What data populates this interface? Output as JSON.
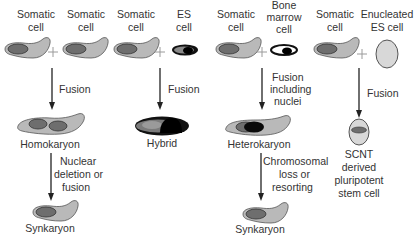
{
  "colors": {
    "cytoplasm": "#b9b9b9",
    "cytoplasm_stroke": "#555555",
    "nucleus": "#6e6e6e",
    "nucleus_dark": "#0a0a0a",
    "es_outline": "#111111",
    "enucleated": "#d8d8d8",
    "text": "#333333"
  },
  "columns": [
    {
      "id": "homokaryon",
      "inputs": [
        {
          "lines": [
            "Somatic",
            "cell"
          ],
          "type": "somatic"
        },
        {
          "lines": [
            "Somatic",
            "cell"
          ],
          "type": "somatic"
        }
      ],
      "step1": {
        "lines": [
          "Fusion"
        ]
      },
      "product1": {
        "label": "Homokaryon",
        "type": "homokaryon"
      },
      "step2": {
        "lines": [
          "Nuclear",
          "deletion or",
          "fusion"
        ]
      },
      "product2": {
        "label": "Synkaryon",
        "type": "somatic"
      }
    },
    {
      "id": "hybrid",
      "inputs": [
        {
          "lines": [
            "Somatic",
            "cell"
          ],
          "type": "somatic"
        },
        {
          "lines": [
            "ES",
            "cell"
          ],
          "type": "es"
        }
      ],
      "step1": {
        "lines": [
          "Fusion"
        ]
      },
      "product1": {
        "label": "Hybrid",
        "type": "hybrid"
      }
    },
    {
      "id": "heterokaryon",
      "inputs": [
        {
          "lines": [
            "Somatic",
            "cell"
          ],
          "type": "somatic"
        },
        {
          "lines": [
            "Bone",
            "marrow",
            "cell"
          ],
          "type": "bone-marrow"
        }
      ],
      "step1": {
        "lines": [
          "Fusion",
          "including",
          "nuclei"
        ]
      },
      "product1": {
        "label": "Heterokaryon",
        "type": "heterokaryon"
      },
      "step2": {
        "lines": [
          "Chromosomal",
          "loss or",
          "resorting"
        ]
      },
      "product2": {
        "label": "Synkaryon",
        "type": "somatic"
      }
    },
    {
      "id": "scnt",
      "inputs": [
        {
          "lines": [
            "Somatic",
            "cell"
          ],
          "type": "somatic"
        },
        {
          "lines": [
            "Enucleated",
            "ES cell"
          ],
          "type": "enucleated"
        }
      ],
      "step1": {
        "lines": [
          "Fusion"
        ]
      },
      "product1": {
        "lines": [
          "SCNT",
          "derived",
          "pluripotent",
          "stem cell"
        ],
        "type": "scnt"
      }
    }
  ]
}
